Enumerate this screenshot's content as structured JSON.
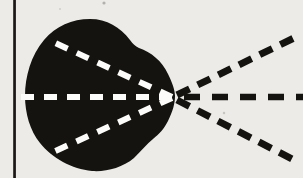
{
  "figure": {
    "name": "eye-light-ray-diagram",
    "canvas": {
      "width": 303,
      "height": 178,
      "background": "#edebe7"
    },
    "border_line": {
      "x": 13.2,
      "width": 2.7,
      "color": "#1a1816"
    },
    "eye": {
      "fill": "#151310",
      "path": "M 25 96 C 25 77 31 55 44 40 C 56 26 72 19 90 19 C 107 19 120 27 130 40 C 133 44 135 46 139 48 C 151 52 162 61 168 74 C 172 82 175 90 175 96 C 175 103 173 111 168 121 C 164 129 159 134 153 139 C 147 144 141 151 134 158 C 122 168 106 172 92 171 C 72 169 52 158 40 143 C 30 131 25 113 25 96 Z",
      "focal_point": {
        "x": 172,
        "y": 97
      }
    },
    "rays": [
      {
        "name": "inner-ray-top",
        "x1": 172,
        "y1": 97,
        "x2": 51,
        "y2": 41,
        "color": "#fcfcfa",
        "width": 6,
        "dash": "13 10"
      },
      {
        "name": "inner-ray-middle",
        "x1": 172,
        "y1": 97,
        "x2": 20,
        "y2": 97,
        "color": "#fcfcfa",
        "width": 6,
        "dash": "13 10"
      },
      {
        "name": "inner-ray-bottom",
        "x1": 172,
        "y1": 98,
        "x2": 51,
        "y2": 153,
        "color": "#fcfcfa",
        "width": 6,
        "dash": "13 10"
      },
      {
        "name": "outer-ray-top",
        "x1": 177,
        "y1": 95,
        "x2": 294,
        "y2": 38,
        "color": "#151310",
        "width": 7,
        "dash": "14 9"
      },
      {
        "name": "outer-ray-middle",
        "x1": 184,
        "y1": 97,
        "x2": 303,
        "y2": 97,
        "color": "#151310",
        "width": 6.5,
        "dash": "16 12"
      },
      {
        "name": "outer-ray-bottom",
        "x1": 177,
        "y1": 100,
        "x2": 294,
        "y2": 160,
        "color": "#151310",
        "width": 7,
        "dash": "14 9"
      }
    ],
    "specks": [
      {
        "x": 104,
        "y": 3,
        "r": 1.6,
        "color": "#9a9894"
      },
      {
        "x": 224,
        "y": 113,
        "r": 1.2,
        "color": "#b5b3af"
      },
      {
        "x": 60,
        "y": 9,
        "r": 1.0,
        "color": "#c4c2be"
      }
    ]
  }
}
